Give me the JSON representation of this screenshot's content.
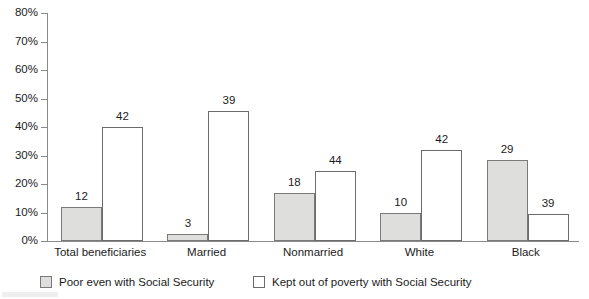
{
  "chart_data": {
    "type": "bar",
    "title": "",
    "subtitle": "",
    "xlabel": "",
    "ylabel": "",
    "grid": false,
    "legend_position": "bottom",
    "ylim": [
      0,
      80
    ],
    "ytick_labels": [
      "80%",
      "70%",
      "60%",
      "50%",
      "40%",
      "30%",
      "20%",
      "10%",
      "0%"
    ],
    "ytick_values": [
      80,
      70,
      60,
      50,
      40,
      30,
      20,
      10,
      0
    ],
    "categories": [
      "Total beneficiaries",
      "Married",
      "Nonmarried",
      "White",
      "Black"
    ],
    "series": [
      {
        "name": "Poor even with Social Security",
        "color": "#dededd",
        "values": [
          12,
          3,
          18,
          10,
          29
        ],
        "plotted_heights": [
          12.0,
          2.5,
          17.0,
          9.7,
          28.5
        ],
        "labels": [
          "12",
          "3",
          "18",
          "10",
          "29"
        ]
      },
      {
        "name": "Kept out of poverty with Social Security",
        "color": "#ffffff",
        "values": [
          42,
          39,
          44,
          42,
          39
        ],
        "plotted_heights": [
          40.0,
          45.7,
          24.5,
          31.8,
          9.5
        ],
        "labels": [
          "42",
          "39",
          "44",
          "42",
          "39"
        ]
      }
    ]
  },
  "legend": {
    "entries": [
      {
        "label": "Poor even with Social Security"
      },
      {
        "label": "Kept out of poverty with Social Security"
      }
    ]
  },
  "colors": {
    "series_poor": "#dededd",
    "series_kept": "#ffffff",
    "axis": "#8a8a8a",
    "bar_outline": "#6f6f6f",
    "text": "#1b1b1b",
    "background": "#ffffff"
  }
}
